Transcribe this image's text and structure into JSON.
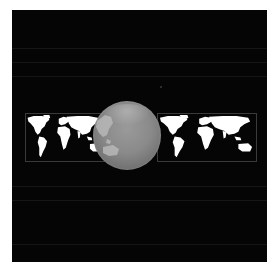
{
  "scene": {
    "description": "Gray 3D globe centered over a wide world map on a black background",
    "background_color": "#050505",
    "page_color": "#ffffff",
    "map_land_color": "#ffffff",
    "map_border_color": "#3a3a3a",
    "globe_color": "#8a8a8a",
    "globe_land_color": "#b8b8b8"
  },
  "elements": {
    "left_map": {
      "label": "world-map-left"
    },
    "right_map": {
      "label": "world-map-right"
    },
    "globe": {
      "label": "globe"
    }
  }
}
